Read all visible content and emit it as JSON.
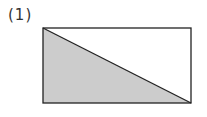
{
  "problem": {
    "label": "(1)"
  },
  "figure": {
    "shape": "rectangle divided by diagonal",
    "rectangle": {
      "x": 43,
      "y": 28,
      "width": 148,
      "height": 75
    },
    "shaded_region": "lower-left triangle",
    "colors": {
      "stroke": "#222222",
      "shade": "#cccccc",
      "background": "#ffffff"
    }
  }
}
